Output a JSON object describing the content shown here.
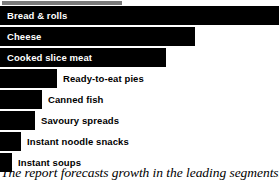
{
  "figure": {
    "caption": "The report forecasts growth in the leading segments.",
    "title_cropped": true
  },
  "chart_data": {
    "type": "bar",
    "orientation": "horizontal",
    "title": "",
    "xlabel": "",
    "ylabel": "",
    "grid": false,
    "legend": null,
    "bar_color": "#000000",
    "categories": [
      "Bread & rolls",
      "Cheese",
      "Cooked slice meat",
      "Ready-to-eat pies",
      "Canned fish",
      "Savoury spreads",
      "Instant noodle snacks",
      "Instant soups"
    ],
    "values": [
      279,
      195,
      166,
      57,
      42,
      35,
      21,
      12
    ],
    "value_unit": "px-bar-length",
    "xlim": [
      0,
      279
    ],
    "bars": [
      {
        "label": "Bread & rolls",
        "length_px": 279,
        "label_position": "inside",
        "label_color": "#ffffff"
      },
      {
        "label": "Cheese",
        "length_px": 195,
        "label_position": "inside",
        "label_color": "#ffffff"
      },
      {
        "label": "Cooked slice meat",
        "length_px": 166,
        "label_position": "inside",
        "label_color": "#ffffff"
      },
      {
        "label": "Ready-to-eat pies",
        "length_px": 57,
        "label_position": "outside",
        "label_color": "#000000"
      },
      {
        "label": "Canned fish",
        "length_px": 42,
        "label_position": "outside",
        "label_color": "#000000"
      },
      {
        "label": "Savoury spreads",
        "length_px": 35,
        "label_position": "outside",
        "label_color": "#000000"
      },
      {
        "label": "Instant noodle snacks",
        "length_px": 21,
        "label_position": "outside",
        "label_color": "#000000"
      },
      {
        "label": "Instant soups",
        "length_px": 12,
        "label_position": "outside",
        "label_color": "#000000"
      }
    ]
  }
}
